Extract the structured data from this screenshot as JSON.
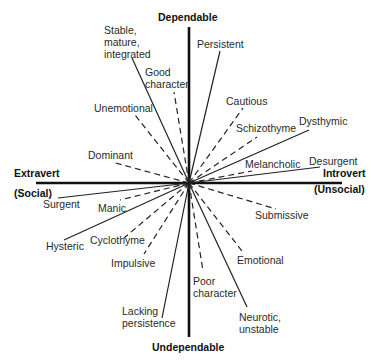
{
  "diagram": {
    "type": "personality-dimensions-circumplex",
    "axes": {
      "top": "Dependable",
      "bottom": "Undependable",
      "left_line1": "Extravert",
      "left_line2": "(Social)",
      "right_line1": "Introvert",
      "right_line2": "(Unsocial)"
    },
    "center": [
      189,
      183
    ],
    "solid_lines": [
      {
        "label": "Stable,\nmature,\nintegrated",
        "end": [
          132,
          58
        ]
      },
      {
        "label": "Persistent",
        "end": [
          220,
          51
        ]
      },
      {
        "label": "Dysthymic",
        "end": [
          309,
          130
        ]
      },
      {
        "label": "Desurgent",
        "end": [
          320,
          167
        ]
      },
      {
        "label": "Surgent",
        "end": [
          58,
          198
        ]
      },
      {
        "label": "Hysteric",
        "end": [
          64,
          240
        ]
      },
      {
        "label": "Lacking\npersistence",
        "end": [
          162,
          318
        ]
      },
      {
        "label": "Neurotic,\nunstable",
        "end": [
          247,
          307
        ]
      }
    ],
    "dashed_lines": [
      {
        "label": "Good\ncharacter",
        "end": [
          174,
          92
        ]
      },
      {
        "label": "Unemotional",
        "end": [
          135,
          115
        ]
      },
      {
        "label": "Dominant",
        "end": [
          112,
          162
        ]
      },
      {
        "label": "Cautious",
        "end": [
          243,
          108
        ]
      },
      {
        "label": "Schizothyme",
        "end": [
          257,
          137
        ]
      },
      {
        "label": "Melancholic",
        "end": [
          252,
          171
        ]
      },
      {
        "label": "Manic",
        "end": [
          120,
          200
        ]
      },
      {
        "label": "Cyclothyme",
        "end": [
          124,
          238
        ]
      },
      {
        "label": "Impulsive",
        "end": [
          144,
          254
        ]
      },
      {
        "label": "Submissive",
        "end": [
          276,
          209
        ]
      },
      {
        "label": "Emotional",
        "end": [
          242,
          251
        ]
      },
      {
        "label": "Poor\ncharacter",
        "end": [
          203,
          271
        ]
      }
    ],
    "colors": {
      "line": "#222222",
      "axis": "#111111",
      "text": "#2a2a2a"
    }
  }
}
